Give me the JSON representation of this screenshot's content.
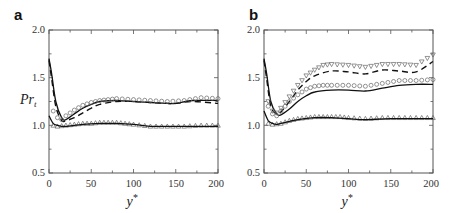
{
  "figure": {
    "panels": [
      {
        "label": "a",
        "xlabel": "y*",
        "ylabel": "Pr_t"
      },
      {
        "label": "b",
        "xlabel": "y*",
        "ylabel": ""
      }
    ],
    "x_ticks": [
      "0",
      "50",
      "100",
      "150",
      "200"
    ],
    "y_ticks": [
      "0.5",
      "1.0",
      "1.5",
      "2.0"
    ]
  },
  "chart_data": [
    {
      "type": "line",
      "title": "a",
      "xlabel": "y*",
      "ylabel": "Pr_t",
      "xlim": [
        0,
        200
      ],
      "ylim": [
        0.5,
        2.0
      ],
      "x_ticks": [
        0,
        50,
        100,
        150,
        200
      ],
      "y_ticks": [
        0.5,
        1.0,
        1.5,
        2.0
      ],
      "grid": false,
      "legend": null,
      "series": [
        {
          "name": "solid line",
          "style": "solid",
          "x": [
            0,
            3,
            8,
            15,
            20,
            30,
            40,
            50,
            60,
            80,
            100,
            120,
            140,
            150,
            170,
            200
          ],
          "y": [
            1.7,
            1.55,
            1.25,
            1.08,
            1.06,
            1.12,
            1.18,
            1.22,
            1.25,
            1.26,
            1.25,
            1.24,
            1.23,
            1.23,
            1.26,
            1.26
          ]
        },
        {
          "name": "dashed line",
          "style": "dashed",
          "x": [
            0,
            3,
            8,
            15,
            20,
            30,
            40,
            50,
            60,
            80,
            100,
            120,
            140,
            150,
            170,
            200
          ],
          "y": [
            1.68,
            1.5,
            1.2,
            1.05,
            1.05,
            1.08,
            1.13,
            1.18,
            1.22,
            1.25,
            1.25,
            1.24,
            1.23,
            1.23,
            1.25,
            1.23
          ]
        },
        {
          "name": "circles",
          "style": "marker-circle",
          "x": [
            5,
            10,
            15,
            20,
            30,
            40,
            50,
            60,
            70,
            80,
            100,
            120,
            140,
            160,
            180,
            200
          ],
          "y": [
            1.15,
            1.08,
            1.06,
            1.1,
            1.16,
            1.21,
            1.24,
            1.26,
            1.27,
            1.28,
            1.27,
            1.26,
            1.25,
            1.26,
            1.29,
            1.28
          ]
        },
        {
          "name": "triangles up",
          "style": "marker-triangle-up",
          "x": [
            5,
            10,
            20,
            30,
            40,
            50,
            60,
            70,
            80,
            90,
            100,
            120,
            140,
            160,
            180,
            200
          ],
          "y": [
            1.0,
            0.99,
            1.0,
            1.01,
            1.02,
            1.02,
            1.03,
            1.03,
            1.03,
            1.02,
            1.01,
            0.99,
            0.99,
            0.99,
            1.0,
            1.0
          ]
        },
        {
          "name": "solid lower line",
          "style": "solid",
          "x": [
            0,
            5,
            10,
            15,
            20,
            40,
            60,
            80,
            100,
            120,
            150,
            200
          ],
          "y": [
            1.1,
            1.02,
            1.0,
            0.99,
            0.99,
            1.01,
            1.02,
            1.02,
            1.01,
            0.99,
            0.99,
            0.99
          ]
        }
      ]
    },
    {
      "type": "line",
      "title": "b",
      "xlabel": "y*",
      "ylabel": "",
      "xlim": [
        0,
        200
      ],
      "ylim": [
        0.5,
        2.0
      ],
      "x_ticks": [
        0,
        50,
        100,
        150,
        200
      ],
      "y_ticks": [
        0.5,
        1.0,
        1.5,
        2.0
      ],
      "grid": false,
      "legend": null,
      "series": [
        {
          "name": "solid line",
          "style": "solid",
          "x": [
            0,
            3,
            8,
            15,
            20,
            30,
            40,
            50,
            60,
            80,
            100,
            120,
            140,
            160,
            180,
            200
          ],
          "y": [
            1.7,
            1.55,
            1.25,
            1.12,
            1.11,
            1.17,
            1.25,
            1.31,
            1.35,
            1.37,
            1.37,
            1.36,
            1.39,
            1.42,
            1.43,
            1.43
          ]
        },
        {
          "name": "dashed line",
          "style": "dashed",
          "x": [
            0,
            3,
            8,
            15,
            20,
            30,
            40,
            50,
            60,
            80,
            100,
            120,
            140,
            160,
            180,
            200
          ],
          "y": [
            1.68,
            1.5,
            1.2,
            1.12,
            1.14,
            1.25,
            1.37,
            1.46,
            1.52,
            1.57,
            1.56,
            1.54,
            1.58,
            1.57,
            1.56,
            1.67
          ]
        },
        {
          "name": "circles",
          "style": "marker-circle",
          "x": [
            5,
            10,
            15,
            20,
            30,
            40,
            50,
            60,
            70,
            80,
            100,
            120,
            140,
            160,
            180,
            200
          ],
          "y": [
            1.2,
            1.12,
            1.1,
            1.15,
            1.25,
            1.32,
            1.38,
            1.41,
            1.42,
            1.42,
            1.42,
            1.41,
            1.44,
            1.47,
            1.47,
            1.48
          ]
        },
        {
          "name": "triangles down",
          "style": "marker-triangle-down",
          "x": [
            5,
            10,
            15,
            20,
            30,
            40,
            50,
            60,
            70,
            80,
            100,
            120,
            140,
            160,
            180,
            200
          ],
          "y": [
            1.25,
            1.15,
            1.13,
            1.18,
            1.3,
            1.42,
            1.52,
            1.58,
            1.63,
            1.64,
            1.63,
            1.61,
            1.64,
            1.64,
            1.63,
            1.74
          ]
        },
        {
          "name": "triangles up",
          "style": "marker-triangle-up",
          "x": [
            5,
            10,
            20,
            30,
            40,
            50,
            60,
            70,
            80,
            90,
            100,
            120,
            140,
            160,
            180,
            200
          ],
          "y": [
            1.02,
            1.01,
            1.02,
            1.05,
            1.07,
            1.08,
            1.09,
            1.09,
            1.09,
            1.09,
            1.08,
            1.07,
            1.08,
            1.08,
            1.08,
            1.08
          ]
        },
        {
          "name": "solid lower line",
          "style": "solid",
          "x": [
            0,
            5,
            10,
            15,
            20,
            40,
            60,
            80,
            100,
            120,
            150,
            200
          ],
          "y": [
            1.15,
            1.05,
            1.02,
            1.01,
            1.02,
            1.06,
            1.08,
            1.08,
            1.07,
            1.06,
            1.07,
            1.07
          ]
        }
      ]
    }
  ]
}
